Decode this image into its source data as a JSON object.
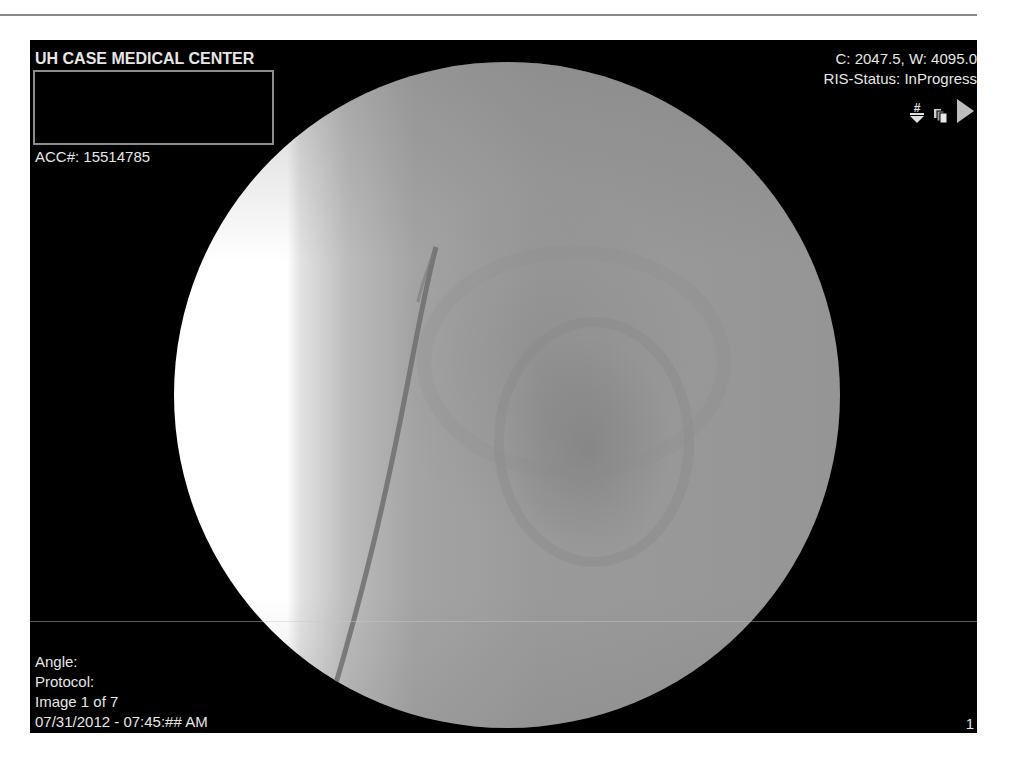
{
  "viewer": {
    "institution": "UH CASE MEDICAL CENTER",
    "accession": "ACC#: 15514785",
    "window_level": "C: 2047.5, W: 4095.0",
    "ris_status": "RIS-Status: InProgress",
    "tools": [
      {
        "icon": "hash-down-arrow-icon",
        "label": "#"
      },
      {
        "icon": "stacked-images-icon"
      },
      {
        "icon": "play-icon"
      }
    ],
    "angle": "Angle:",
    "protocol": "Protocol:",
    "image_index": "Image 1 of 7",
    "datetime": "07/31/2012 - 07:45:## AM",
    "frame_number": "1"
  },
  "colors": {
    "background": "#000000",
    "overlay_text": "#e6e6e6",
    "name_box_border": "#8c8c8c"
  }
}
